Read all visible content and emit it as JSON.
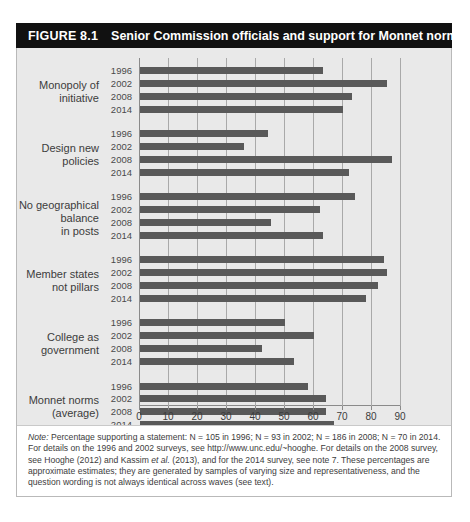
{
  "figure": {
    "number_label": "FIGURE 8.1",
    "title": "Senior Commission officials and support for Monnet norms"
  },
  "chart_data": {
    "type": "bar",
    "orientation": "horizontal",
    "title": "Senior Commission officials and support for Monnet norms",
    "xlabel": "",
    "ylabel": "",
    "xlim": [
      0,
      90
    ],
    "xticks": [
      0,
      10,
      20,
      30,
      40,
      50,
      60,
      70,
      80,
      90
    ],
    "grid": true,
    "legend": "none",
    "categories": [
      "Monopoly of initiative",
      "Design new policies",
      "No geographical balance in posts",
      "Member states not pillars",
      "College as government",
      "Monnet norms (average)"
    ],
    "series_labels": [
      "1996",
      "2002",
      "2008",
      "2014"
    ],
    "groups": [
      {
        "category_lines": [
          "Monopoly of",
          "initiative"
        ],
        "bars": [
          {
            "year": "1996",
            "value": 63
          },
          {
            "year": "2002",
            "value": 85
          },
          {
            "year": "2008",
            "value": 73
          },
          {
            "year": "2014",
            "value": 70
          }
        ]
      },
      {
        "category_lines": [
          "Design new",
          "policies"
        ],
        "bars": [
          {
            "year": "1996",
            "value": 44
          },
          {
            "year": "2002",
            "value": 36
          },
          {
            "year": "2008",
            "value": 87
          },
          {
            "year": "2014",
            "value": 72
          }
        ]
      },
      {
        "category_lines": [
          "No geographical",
          "balance",
          "in posts"
        ],
        "bars": [
          {
            "year": "1996",
            "value": 74
          },
          {
            "year": "2002",
            "value": 62
          },
          {
            "year": "2008",
            "value": 45
          },
          {
            "year": "2014",
            "value": 63
          }
        ]
      },
      {
        "category_lines": [
          "Member states",
          "not pillars"
        ],
        "bars": [
          {
            "year": "1996",
            "value": 84
          },
          {
            "year": "2002",
            "value": 85
          },
          {
            "year": "2008",
            "value": 82
          },
          {
            "year": "2014",
            "value": 78
          }
        ]
      },
      {
        "category_lines": [
          "College as",
          "government"
        ],
        "bars": [
          {
            "year": "1996",
            "value": 50
          },
          {
            "year": "2002",
            "value": 60
          },
          {
            "year": "2008",
            "value": 42
          },
          {
            "year": "2014",
            "value": 53
          }
        ]
      },
      {
        "category_lines": [
          "Monnet norms",
          "(average)"
        ],
        "bars": [
          {
            "year": "1996",
            "value": 58
          },
          {
            "year": "2002",
            "value": 64
          },
          {
            "year": "2008",
            "value": 64
          },
          {
            "year": "2014",
            "value": 67
          }
        ]
      }
    ]
  },
  "note": {
    "label": "Note:",
    "body": " Percentage supporting a statement: N = 105 in 1996; N = 93 in 2002; N = 186 in 2008; N = 70 in 2014. For details on the 1996 and 2002 surveys, see http://www.unc.edu/~hooghe. For details on the 2008 survey, see Hooghe (2012) and Kassim ",
    "italic_mid": "et al.",
    "body2": " (2013), and for the 2014 survey, see note 7. These percentages are approximate estimates; they are generated by samples of varying size and representativeness, and the question wording is not always identical across waves (see text)."
  },
  "colors": {
    "bar": "#595959",
    "panel_background": "#e9e9e9",
    "gridline": "#a9a9a9",
    "title_bar": "#111111",
    "text": "#3c3c3c"
  }
}
